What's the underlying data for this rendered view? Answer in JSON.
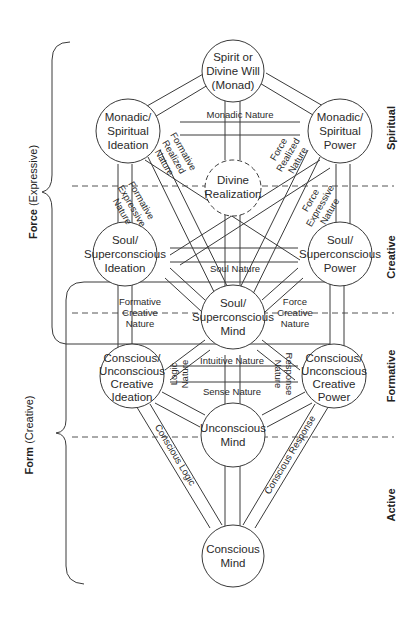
{
  "diagram": {
    "type": "tree-of-life style consciousness diagram",
    "nodes": {
      "spirit": [
        "Spirit or",
        "Divine Will",
        "(Monad)"
      ],
      "monadic_ideation": [
        "Monadic/",
        "Spiritual",
        "Ideation"
      ],
      "monadic_power": [
        "Monadic/",
        "Spiritual",
        "Power"
      ],
      "divine_realization": [
        "Divine",
        "Realization"
      ],
      "soul_ideation": [
        "Soul/",
        "Superconscious",
        "Ideation"
      ],
      "soul_power": [
        "Soul/",
        "Superconscious",
        "Power"
      ],
      "soul_mind": [
        "Soul/",
        "Superconscious",
        "Mind"
      ],
      "conscious_ideation": [
        "Conscious/",
        "Unconscious",
        "Creative",
        "Ideation"
      ],
      "conscious_power": [
        "Conscious/",
        "Unconscious",
        "Creative",
        "Power"
      ],
      "unconscious_mind": [
        "Unconscious",
        "Mind"
      ],
      "conscious_mind": [
        "Conscious",
        "Mind"
      ]
    },
    "channels": {
      "monadic_nature": "Monadic Nature",
      "formative_realized": [
        "Formative",
        "Realized",
        "Nature"
      ],
      "force_realized": [
        "Force",
        "Realized",
        "Nature"
      ],
      "formative_expressive": [
        "Formative",
        "Expressive",
        "Nature"
      ],
      "force_expressive": [
        "Force",
        "Expressive",
        "Nature"
      ],
      "soul_nature": "Soul Nature",
      "formative_creative": [
        "Formative",
        "Creative",
        "Nature"
      ],
      "force_creative": [
        "Force",
        "Creative",
        "Nature"
      ],
      "intuitive_nature": "Intuitive Nature",
      "sense_nature": "Sense Nature",
      "logic_nature": [
        "Logic",
        "Nature"
      ],
      "response_nature": [
        "Response",
        "Nature"
      ],
      "conscious_logic": "Conscious Logic",
      "conscious_response": "Conscious Response"
    },
    "levels": [
      "Spiritual",
      "Creative",
      "Formative",
      "Active"
    ],
    "braces": {
      "force": {
        "bold": "Force",
        "rest": " (Expressive)"
      },
      "form": {
        "bold": "Form",
        "rest": " (Creative)"
      }
    }
  }
}
